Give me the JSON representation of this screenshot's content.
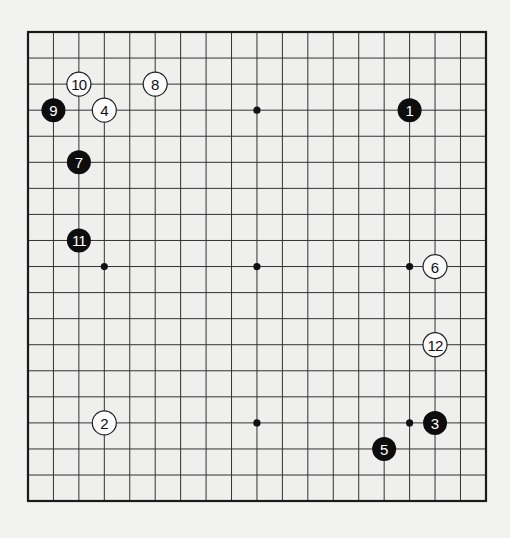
{
  "board": {
    "size": 19,
    "origin": {
      "x": 28,
      "y": 32
    },
    "spacing": {
      "x": 25.44,
      "y": 26.06
    },
    "line_color": "#333333",
    "edge_color": "#1a1a1a",
    "surface_color": "#efefee",
    "star_points": [
      [
        3,
        3
      ],
      [
        9,
        3
      ],
      [
        15,
        3
      ],
      [
        3,
        9
      ],
      [
        9,
        9
      ],
      [
        15,
        9
      ],
      [
        3,
        15
      ],
      [
        9,
        15
      ],
      [
        15,
        15
      ]
    ]
  },
  "moves": [
    {
      "number": "1",
      "color": "black",
      "col": 15,
      "row": 3
    },
    {
      "number": "2",
      "color": "white",
      "col": 3,
      "row": 15
    },
    {
      "number": "3",
      "color": "black",
      "col": 16,
      "row": 15
    },
    {
      "number": "4",
      "color": "white",
      "col": 3,
      "row": 3
    },
    {
      "number": "5",
      "color": "black",
      "col": 14,
      "row": 16
    },
    {
      "number": "6",
      "color": "white",
      "col": 16,
      "row": 9
    },
    {
      "number": "7",
      "color": "black",
      "col": 2,
      "row": 5
    },
    {
      "number": "8",
      "color": "white",
      "col": 5,
      "row": 2
    },
    {
      "number": "9",
      "color": "black",
      "col": 1,
      "row": 3
    },
    {
      "number": "10",
      "color": "white",
      "col": 2,
      "row": 2
    },
    {
      "number": "11",
      "color": "black",
      "col": 2,
      "row": 8
    },
    {
      "number": "12",
      "color": "white",
      "col": 16,
      "row": 12
    }
  ]
}
